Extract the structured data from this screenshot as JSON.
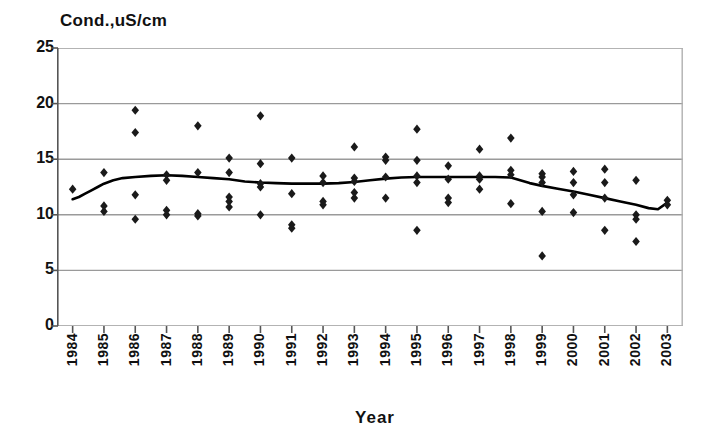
{
  "chart": {
    "type": "scatter",
    "y_axis_title": "Cond.,uS/cm",
    "x_axis_title": "Year"
  },
  "chart_data": {
    "type": "scatter",
    "title": "",
    "subtitle": "",
    "xlabel": "Year",
    "ylabel": "Cond.,uS/cm",
    "xlim": [
      1983.5,
      2003.5
    ],
    "ylim": [
      0,
      25
    ],
    "yticks": [
      0,
      5,
      10,
      15,
      20,
      25
    ],
    "xticks": [
      1984,
      1985,
      1986,
      1987,
      1988,
      1989,
      1990,
      1991,
      1992,
      1993,
      1994,
      1995,
      1996,
      1997,
      1998,
      1999,
      2000,
      2001,
      2002,
      2003
    ],
    "grid": "horizontal",
    "legend": "none",
    "marker": "diamond",
    "marker_color": "#1a1a1a",
    "line_color": "#000000",
    "series": [
      {
        "name": "Conductivity observations",
        "type": "scatter",
        "points": [
          [
            1984,
            12.3
          ],
          [
            1985,
            13.8
          ],
          [
            1985,
            10.8
          ],
          [
            1985,
            10.3
          ],
          [
            1986,
            19.4
          ],
          [
            1986,
            17.4
          ],
          [
            1986,
            11.8
          ],
          [
            1986,
            9.6
          ],
          [
            1987,
            13.6
          ],
          [
            1987,
            13.1
          ],
          [
            1987,
            10.4
          ],
          [
            1987,
            10.0
          ],
          [
            1988,
            18.0
          ],
          [
            1988,
            13.8
          ],
          [
            1988,
            10.1
          ],
          [
            1988,
            9.9
          ],
          [
            1989,
            15.1
          ],
          [
            1989,
            13.8
          ],
          [
            1989,
            11.6
          ],
          [
            1989,
            11.2
          ],
          [
            1989,
            10.7
          ],
          [
            1990,
            18.9
          ],
          [
            1990,
            14.6
          ],
          [
            1990,
            12.8
          ],
          [
            1990,
            12.5
          ],
          [
            1990,
            10.0
          ],
          [
            1991,
            15.1
          ],
          [
            1991,
            11.9
          ],
          [
            1991,
            9.1
          ],
          [
            1991,
            8.8
          ],
          [
            1992,
            13.5
          ],
          [
            1992,
            12.9
          ],
          [
            1992,
            11.2
          ],
          [
            1992,
            10.9
          ],
          [
            1993,
            16.1
          ],
          [
            1993,
            13.3
          ],
          [
            1993,
            13.0
          ],
          [
            1993,
            12.0
          ],
          [
            1993,
            11.5
          ],
          [
            1994,
            15.2
          ],
          [
            1994,
            14.9
          ],
          [
            1994,
            13.4
          ],
          [
            1994,
            11.5
          ],
          [
            1995,
            17.7
          ],
          [
            1995,
            14.9
          ],
          [
            1995,
            13.5
          ],
          [
            1995,
            12.9
          ],
          [
            1995,
            8.6
          ],
          [
            1996,
            14.4
          ],
          [
            1996,
            13.2
          ],
          [
            1996,
            11.5
          ],
          [
            1996,
            11.1
          ],
          [
            1997,
            15.9
          ],
          [
            1997,
            13.5
          ],
          [
            1997,
            13.2
          ],
          [
            1997,
            12.3
          ],
          [
            1998,
            16.9
          ],
          [
            1998,
            14.0
          ],
          [
            1998,
            13.6
          ],
          [
            1998,
            11.0
          ],
          [
            1999,
            13.7
          ],
          [
            1999,
            13.4
          ],
          [
            1999,
            12.9
          ],
          [
            1999,
            10.3
          ],
          [
            1999,
            6.3
          ],
          [
            2000,
            13.9
          ],
          [
            2000,
            12.9
          ],
          [
            2000,
            11.8
          ],
          [
            2000,
            10.2
          ],
          [
            2001,
            14.1
          ],
          [
            2001,
            12.9
          ],
          [
            2001,
            11.5
          ],
          [
            2001,
            8.6
          ],
          [
            2002,
            13.1
          ],
          [
            2002,
            10.0
          ],
          [
            2002,
            9.6
          ],
          [
            2002,
            7.6
          ],
          [
            2003,
            11.3
          ],
          [
            2003,
            10.9
          ]
        ]
      },
      {
        "name": "Trend line",
        "type": "line",
        "points": [
          [
            1984,
            11.4
          ],
          [
            1984.2,
            11.6
          ],
          [
            1984.4,
            11.9
          ],
          [
            1984.6,
            12.2
          ],
          [
            1984.8,
            12.5
          ],
          [
            1985,
            12.8
          ],
          [
            1985.3,
            13.1
          ],
          [
            1985.6,
            13.3
          ],
          [
            1986,
            13.4
          ],
          [
            1986.5,
            13.5
          ],
          [
            1987,
            13.55
          ],
          [
            1987.5,
            13.5
          ],
          [
            1988,
            13.4
          ],
          [
            1988.5,
            13.3
          ],
          [
            1989,
            13.2
          ],
          [
            1989.5,
            13.0
          ],
          [
            1990,
            12.9
          ],
          [
            1990.5,
            12.85
          ],
          [
            1991,
            12.8
          ],
          [
            1991.5,
            12.8
          ],
          [
            1992,
            12.8
          ],
          [
            1992.5,
            12.85
          ],
          [
            1993,
            12.95
          ],
          [
            1993.5,
            13.1
          ],
          [
            1994,
            13.25
          ],
          [
            1994.5,
            13.35
          ],
          [
            1995,
            13.4
          ],
          [
            1995.5,
            13.4
          ],
          [
            1996,
            13.4
          ],
          [
            1996.5,
            13.4
          ],
          [
            1997,
            13.4
          ],
          [
            1997.5,
            13.4
          ],
          [
            1998,
            13.35
          ],
          [
            1998.3,
            13.1
          ],
          [
            1998.6,
            12.85
          ],
          [
            1999,
            12.6
          ],
          [
            1999.5,
            12.35
          ],
          [
            2000,
            12.1
          ],
          [
            2000.5,
            11.8
          ],
          [
            2001,
            11.5
          ],
          [
            2001.5,
            11.2
          ],
          [
            2002,
            10.9
          ],
          [
            2002.4,
            10.6
          ],
          [
            2002.7,
            10.5
          ],
          [
            2003,
            11.1
          ]
        ]
      }
    ]
  }
}
